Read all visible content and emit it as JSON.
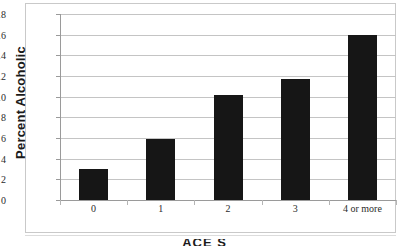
{
  "chart_data": {
    "type": "bar",
    "title": "",
    "xlabel": "ACE Score",
    "ylabel": "Percent Alcoholic",
    "categories": [
      "0",
      "1",
      "2",
      "3",
      "4 or more"
    ],
    "values": [
      3.0,
      5.9,
      10.2,
      11.7,
      16.0
    ],
    "ylim": [
      0,
      18
    ],
    "ytick_step": 2,
    "yticks": [
      "18",
      "16",
      "14",
      "12",
      "10",
      "8",
      "6",
      "4",
      "2",
      "0"
    ],
    "ytick_values": [
      18,
      16,
      14,
      12,
      10,
      8,
      6,
      4,
      2,
      0
    ],
    "grid": true,
    "grid_axis": "y",
    "legend": false,
    "bar_color": "#161616",
    "grid_color": "#c4c4c4",
    "axis_color": "#9a9a9a",
    "background": "#ffffff"
  },
  "axis_titles": {
    "y": "Percent Alcoholic",
    "x_partial": "ACE S"
  }
}
